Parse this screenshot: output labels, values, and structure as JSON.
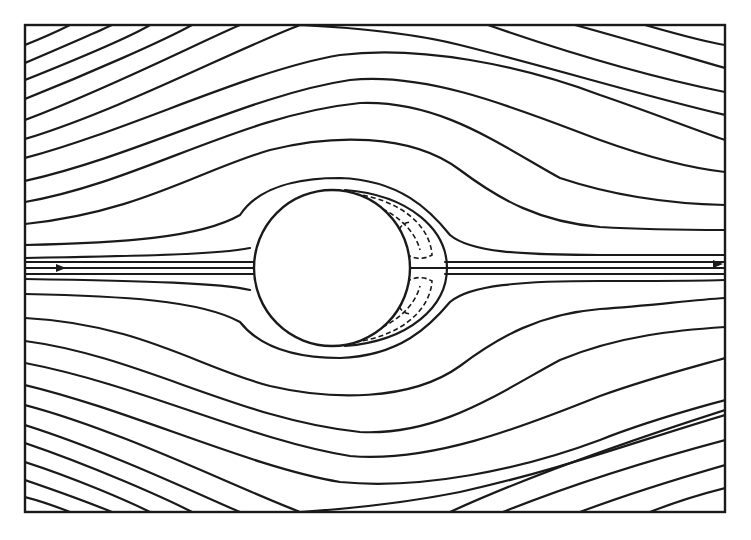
{
  "figure": {
    "title": "",
    "frame": {
      "x": 25,
      "y": 25,
      "width": 700,
      "height": 487
    },
    "cylinder": {
      "cx": 332,
      "cy": 268,
      "r": 78
    },
    "wake_bubble": {
      "outer_x": 445,
      "center_y": 268
    },
    "flow_direction": "left-to-right",
    "arrows": [
      {
        "name": "inflow-arrow",
        "x": 60,
        "y": 268
      },
      {
        "name": "outflow-arrow",
        "x": 718,
        "y": 264
      }
    ],
    "colors": {
      "line": "#1a1a1a",
      "background": "#ffffff"
    }
  }
}
